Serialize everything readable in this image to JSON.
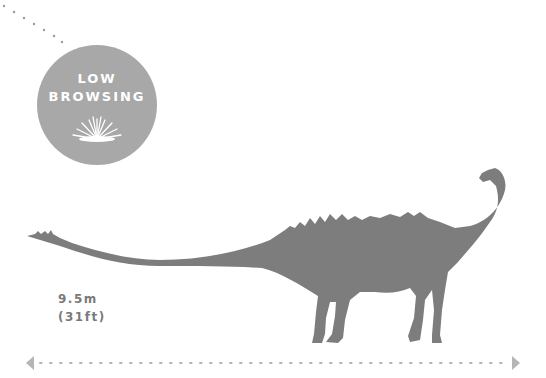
{
  "badge": {
    "title_line1": "LOW",
    "title_line2": "BROWSING",
    "icon": "grass-tuft-icon",
    "color": "#a8a8a8"
  },
  "dinosaur": {
    "icon": "sauropod-silhouette-icon",
    "color": "#7d7d7d"
  },
  "length": {
    "metric": "9.5m",
    "imperial": "(31ft)"
  },
  "scale_bar": {
    "icon_left": "arrow-left-icon",
    "icon_right": "arrow-right-icon",
    "color": "#b5b5b5"
  }
}
